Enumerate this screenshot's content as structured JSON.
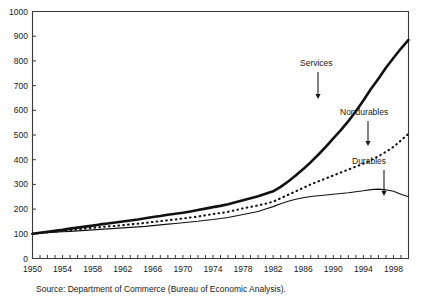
{
  "chart_data": {
    "type": "line",
    "title": "",
    "subtitle": "",
    "xlabel": "",
    "ylabel": "",
    "xlim": [
      1950,
      2000
    ],
    "ylim": [
      0,
      1000
    ],
    "grid": false,
    "legend_position": "inline-annotations",
    "source_note": "Source: Department of Commerce (Bureau of Economic Analysis).",
    "y_ticks": [
      0,
      100,
      200,
      300,
      400,
      500,
      600,
      700,
      800,
      900,
      1000
    ],
    "y_tick_labels": [
      "0",
      "100",
      "200",
      "300",
      "400",
      "500",
      "600",
      "700",
      "800",
      "900",
      "1000"
    ],
    "x_ticks": [
      1950,
      1954,
      1958,
      1962,
      1966,
      1970,
      1974,
      1978,
      1982,
      1986,
      1990,
      1994,
      1998
    ],
    "x_tick_labels": [
      "1950",
      "1954",
      "1958",
      "1962",
      "1966",
      "1970",
      "1974",
      "1978",
      "1982",
      "1986",
      "1990",
      "1994",
      "1998"
    ],
    "x_minor_tick_step": 1,
    "x": [
      1950,
      1951,
      1952,
      1953,
      1954,
      1955,
      1956,
      1957,
      1958,
      1959,
      1960,
      1961,
      1962,
      1963,
      1964,
      1965,
      1966,
      1967,
      1968,
      1969,
      1970,
      1971,
      1972,
      1973,
      1974,
      1975,
      1976,
      1977,
      1978,
      1979,
      1980,
      1981,
      1982,
      1983,
      1984,
      1985,
      1986,
      1987,
      1988,
      1989,
      1990,
      1991,
      1992,
      1993,
      1994,
      1995,
      1996,
      1997,
      1998,
      1999,
      2000
    ],
    "series": [
      {
        "name": "Services",
        "style": "thick-solid",
        "color": "#111111",
        "values": [
          100,
          104,
          108,
          112,
          116,
          121,
          125,
          129,
          133,
          138,
          142,
          146,
          150,
          154,
          158,
          163,
          168,
          172,
          177,
          181,
          185,
          190,
          196,
          202,
          208,
          213,
          220,
          228,
          236,
          244,
          252,
          262,
          272,
          290,
          312,
          336,
          362,
          390,
          420,
          452,
          486,
          520,
          556,
          596,
          640,
          686,
          728,
          772,
          812,
          850,
          885
        ]
      },
      {
        "name": "Nondurables",
        "style": "dotted",
        "color": "#111111",
        "values": [
          100,
          103,
          106,
          109,
          112,
          115,
          118,
          121,
          124,
          127,
          130,
          132,
          135,
          138,
          141,
          144,
          148,
          151,
          155,
          158,
          162,
          166,
          170,
          175,
          180,
          184,
          189,
          196,
          203,
          209,
          215,
          222,
          230,
          244,
          258,
          272,
          286,
          300,
          312,
          324,
          336,
          348,
          360,
          372,
          384,
          398,
          414,
          432,
          452,
          478,
          505
        ]
      },
      {
        "name": "Durables",
        "style": "thin-solid",
        "color": "#111111",
        "values": [
          100,
          102,
          104,
          106,
          108,
          110,
          112,
          114,
          116,
          118,
          120,
          122,
          124,
          126,
          128,
          130,
          133,
          136,
          139,
          142,
          145,
          148,
          151,
          155,
          158,
          162,
          166,
          172,
          178,
          184,
          190,
          200,
          210,
          222,
          232,
          240,
          246,
          251,
          254,
          257,
          260,
          263,
          266,
          270,
          274,
          279,
          281,
          278,
          272,
          260,
          250
        ]
      }
    ],
    "annotations": [
      {
        "name": "Services",
        "label": "Services",
        "label_x": 300,
        "label_y": 66,
        "arrow_x": 318,
        "arrow_y_top": 72,
        "arrow_y_bottom": 99
      },
      {
        "name": "Nondurables",
        "label": "Nondurables",
        "label_x": 340,
        "label_y": 115,
        "arrow_x": 368,
        "arrow_y_top": 121,
        "arrow_y_bottom": 146
      },
      {
        "name": "Durables",
        "label": "Durables",
        "label_x": 352,
        "label_y": 164,
        "arrow_x": 384,
        "arrow_y_top": 170,
        "arrow_y_bottom": 196
      }
    ]
  }
}
